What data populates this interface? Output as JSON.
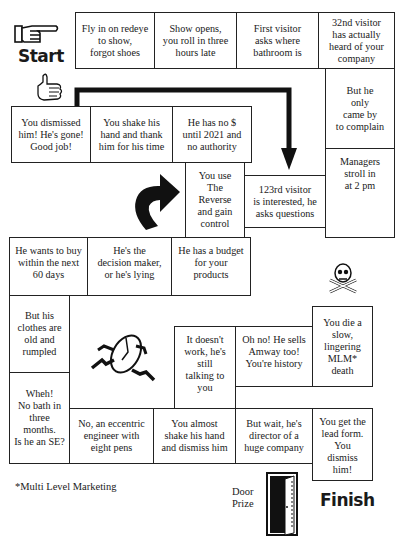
{
  "labels": {
    "start": "Start",
    "finish": "Finish",
    "door_prize": "Door\nPrize",
    "footnote": "*Multi Level Marketing"
  },
  "squares": [
    {
      "id": "s1",
      "text": "Fly in on redeye\nto show,\nforgot shoes"
    },
    {
      "id": "s2",
      "text": "Show opens,\nyou roll in three\nhours late"
    },
    {
      "id": "s3",
      "text": "First visitor\nasks where\nbathroom is"
    },
    {
      "id": "s4",
      "text": "32nd visitor\nhas actually\nheard of your\ncompany"
    },
    {
      "id": "s5",
      "text": "But he\nonly\ncame by\nto complain"
    },
    {
      "id": "s6",
      "text": "Managers\nstroll in\nat 2 pm"
    },
    {
      "id": "s7",
      "text": "123rd visitor\nis interested, he\nasks questions"
    },
    {
      "id": "s8",
      "text": "You use\nThe\nReverse\nand gain\ncontrol"
    },
    {
      "id": "s9",
      "text": "He has no $\nuntil 2021 and\nno authority"
    },
    {
      "id": "s10",
      "text": "You shake his\nhand and thank\nhim for his time"
    },
    {
      "id": "s11",
      "text": "You dismissed\nhim!  He's gone!\nGood job!"
    },
    {
      "id": "s12",
      "text": "He has a budget\nfor your\nproducts"
    },
    {
      "id": "s13",
      "text": "He's the\ndecision maker,\nor he's lying"
    },
    {
      "id": "s14",
      "text": "He wants to buy\nwithin the next\n60 days"
    },
    {
      "id": "s15",
      "text": "But his\nclothes are\nold and\nrumpled"
    },
    {
      "id": "s16",
      "text": "Wheh!\nNo bath in\nthree\nmonths.\nIs he an SE?"
    },
    {
      "id": "s17",
      "text": "No, an eccentric\nengineer with\neight pens"
    },
    {
      "id": "s18",
      "text": "You almost\nshake his hand\nand dismiss him"
    },
    {
      "id": "s19",
      "text": "But wait, he's\ndirector of a\nhuge company"
    },
    {
      "id": "s20",
      "text": "It doesn't\nwork, he's\nstill\ntalking to\nyou"
    },
    {
      "id": "s21",
      "text": "Oh no! He sells\nAmway too!\nYou're history"
    },
    {
      "id": "s22",
      "text": "You die a\nslow,\nlingering\nMLM*\ndeath"
    },
    {
      "id": "s23",
      "text": "You get the\nlead form.\nYou\ndismiss\nhim!"
    }
  ],
  "icons": [
    "pointing-hand",
    "thumbs-up",
    "curved-arrow",
    "down-arrow-path",
    "running-clock",
    "skull-crossbones",
    "open-door"
  ]
}
